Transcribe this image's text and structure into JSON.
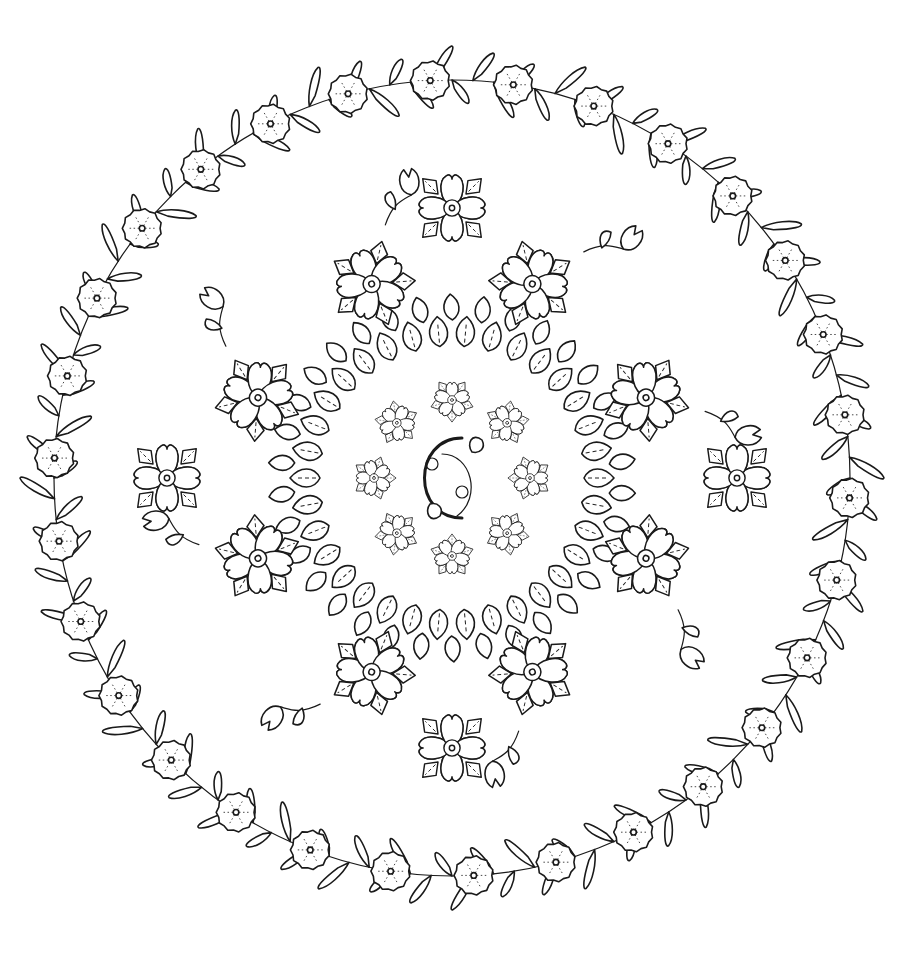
{
  "image": {
    "subject": "floral mandala coloring page",
    "style": "black line art on white",
    "colors": {
      "line": "#1a1a1a",
      "background": "#ffffff"
    }
  },
  "layout": {
    "center": [
      452,
      478
    ],
    "outer_wreath": {
      "radius": 398,
      "pompom_count": 30,
      "pompom_radius": 18,
      "frond_count": 120
    },
    "ring_leaves": {
      "radius": 138,
      "count": 34
    },
    "inner_flowers": {
      "radius": 78,
      "count": 8
    },
    "mid_flowers": {
      "radius": 210,
      "count": 8
    },
    "heart_flowers": {
      "radius": 290,
      "count": 4
    },
    "buds": {
      "radius": 300,
      "count": 8
    }
  }
}
